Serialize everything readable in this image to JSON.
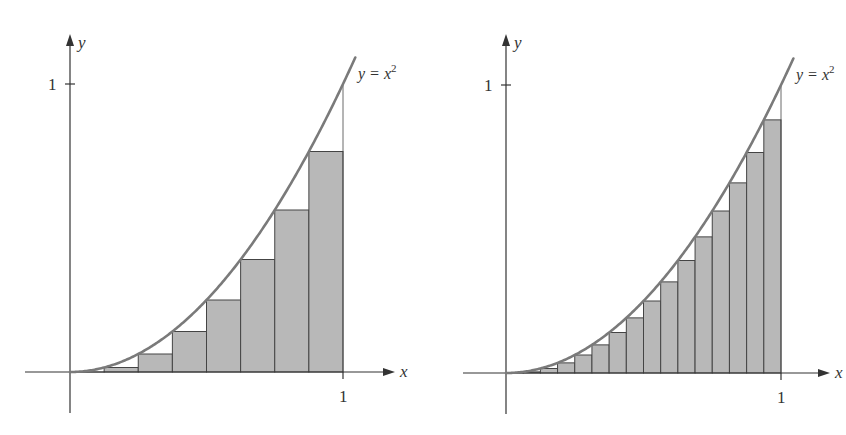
{
  "chart_data": [
    {
      "type": "bar",
      "title": "",
      "description": "Left-endpoint Riemann sum for y = x^2 on [0,1], n = 8",
      "curve_label": "y = x",
      "curve_exponent": "2",
      "xlabel": "x",
      "ylabel": "y",
      "x_tick_label": "1",
      "y_tick_label": "1",
      "xlim": [
        0,
        1
      ],
      "ylim": [
        0,
        1
      ],
      "n": 8,
      "categories": [
        0,
        0.125,
        0.25,
        0.375,
        0.5,
        0.625,
        0.75,
        0.875
      ],
      "values": [
        0,
        0.015625,
        0.0625,
        0.140625,
        0.25,
        0.390625,
        0.5625,
        0.765625
      ],
      "grid": false
    },
    {
      "type": "bar",
      "title": "",
      "description": "Left-endpoint Riemann sum for y = x^2 on [0,1], n = 16",
      "curve_label": "y = x",
      "curve_exponent": "2",
      "xlabel": "x",
      "ylabel": "y",
      "x_tick_label": "1",
      "y_tick_label": "1",
      "xlim": [
        0,
        1
      ],
      "ylim": [
        0,
        1
      ],
      "n": 16,
      "categories": [
        0,
        0.0625,
        0.125,
        0.1875,
        0.25,
        0.3125,
        0.375,
        0.4375,
        0.5,
        0.5625,
        0.625,
        0.6875,
        0.75,
        0.8125,
        0.875,
        0.9375
      ],
      "values": [
        0,
        0.00390625,
        0.015625,
        0.03515625,
        0.0625,
        0.09765625,
        0.140625,
        0.19140625,
        0.25,
        0.31640625,
        0.390625,
        0.47265625,
        0.5625,
        0.66015625,
        0.765625,
        0.87890625
      ],
      "grid": false
    }
  ],
  "style": {
    "bar_fill": "#b8b8b8",
    "bar_stroke": "#444444",
    "curve_color": "#7a7a7a",
    "axis_color": "#333333"
  },
  "panels": [
    {
      "ox": 70,
      "oy": 372,
      "x1": 343,
      "y1": 84,
      "axisLeft": 25,
      "axisRight": 385,
      "axisTop": 42,
      "axisBottom": 413
    },
    {
      "ox": 506,
      "oy": 373,
      "x1": 781,
      "y1": 85,
      "axisLeft": 463,
      "axisRight": 820,
      "axisTop": 42,
      "axisBottom": 414
    }
  ]
}
